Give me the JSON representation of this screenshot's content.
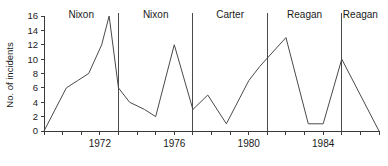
{
  "chart_data": {
    "type": "line",
    "title": "",
    "xlabel": "",
    "ylabel": "No. of incidents",
    "ylim": [
      0,
      16
    ],
    "xlim": [
      1969,
      1987
    ],
    "ytick_labels": [
      "0",
      "2",
      "4",
      "6",
      "8",
      "10",
      "12",
      "14",
      "16"
    ],
    "ytick_values": [
      0,
      2,
      4,
      6,
      8,
      10,
      12,
      14,
      16
    ],
    "xtick_labels": [
      "1972",
      "1976",
      "1980",
      "1984"
    ],
    "xtick_values": [
      1972,
      1976,
      1980,
      1984
    ],
    "xtick_all": [
      1969,
      1970,
      1971,
      1972,
      1973,
      1974,
      1975,
      1976,
      1977,
      1978,
      1979,
      1980,
      1981,
      1982,
      1983,
      1984,
      1985,
      1986,
      1987
    ],
    "grid": false,
    "legend": null,
    "x": [
      1969,
      1970,
      1971,
      1972,
      1973,
      1974,
      1975,
      1976,
      1977,
      1978,
      1979,
      1980,
      1981,
      1982,
      1983,
      1984,
      1985,
      1986,
      1987
    ],
    "values": [
      0,
      6,
      7,
      8,
      12,
      16,
      6,
      4,
      3,
      2,
      12,
      3,
      5,
      1,
      6,
      13,
      1,
      1,
      10
    ],
    "series": [
      {
        "name": "No. of incidents",
        "points": [
          {
            "x": 1969.0,
            "y": 0
          },
          {
            "x": 1970.2,
            "y": 6
          },
          {
            "x": 1970.8,
            "y": 7
          },
          {
            "x": 1971.4,
            "y": 8
          },
          {
            "x": 1972.1,
            "y": 12
          },
          {
            "x": 1972.5,
            "y": 16
          },
          {
            "x": 1973.0,
            "y": 6
          },
          {
            "x": 1973.6,
            "y": 4
          },
          {
            "x": 1974.4,
            "y": 3
          },
          {
            "x": 1975.0,
            "y": 2
          },
          {
            "x": 1976.0,
            "y": 12
          },
          {
            "x": 1977.0,
            "y": 3
          },
          {
            "x": 1977.8,
            "y": 5
          },
          {
            "x": 1978.8,
            "y": 1
          },
          {
            "x": 1980.0,
            "y": 7
          },
          {
            "x": 1980.6,
            "y": 9
          },
          {
            "x": 1982.0,
            "y": 13
          },
          {
            "x": 1983.2,
            "y": 1
          },
          {
            "x": 1984.0,
            "y": 1
          },
          {
            "x": 1985.0,
            "y": 10
          },
          {
            "x": 1987.0,
            "y": 0
          }
        ]
      }
    ],
    "term_dividers": [
      {
        "label": "Nixon",
        "x": 1969.0
      },
      {
        "label": "Nixon",
        "x": 1973.0
      },
      {
        "label": "Carter",
        "x": 1977.0
      },
      {
        "label": "Reagan",
        "x": 1981.0
      },
      {
        "label": "Reagan",
        "x": 1985.0
      }
    ],
    "annotations": [
      "Nixon",
      "Nixon",
      "Carter",
      "Reagan",
      "Reagan"
    ]
  },
  "axes": {
    "y_title": "No. of incidents"
  }
}
